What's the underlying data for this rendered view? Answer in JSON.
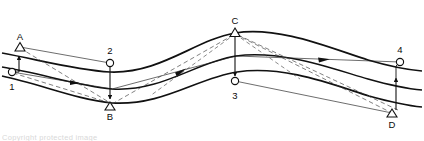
{
  "figure": {
    "stroke_color": "#111111",
    "thin_color": "#2b2b2b",
    "dash_color": "#555555",
    "background": "#ffffff",
    "marker_labels_upper": [
      "A",
      "C"
    ],
    "marker_labels_lower": [
      "B",
      "D"
    ],
    "marker_labels_numeric": [
      "1",
      "2",
      "3",
      "4"
    ],
    "points": [
      {
        "id": "A",
        "label": "A",
        "marker": "triangle",
        "x": 20,
        "y": 47,
        "label_x": 20,
        "label_y": 40
      },
      {
        "id": "B",
        "label": "B",
        "marker": "triangle",
        "x": 110,
        "y": 106,
        "label_x": 110,
        "label_y": 117
      },
      {
        "id": "C",
        "label": "C",
        "marker": "triangle",
        "x": 235,
        "y": 32,
        "label_x": 235,
        "label_y": 24
      },
      {
        "id": "D",
        "label": "D",
        "marker": "triangle",
        "x": 392,
        "y": 113,
        "label_x": 392,
        "label_y": 124
      },
      {
        "id": "1",
        "label": "1",
        "marker": "circle",
        "x": 12,
        "y": 72,
        "label_x": 12,
        "label_y": 88
      },
      {
        "id": "2",
        "label": "2",
        "marker": "circle",
        "x": 110,
        "y": 63,
        "label_x": 110,
        "label_y": 52
      },
      {
        "id": "3",
        "label": "3",
        "marker": "circle",
        "x": 235,
        "y": 81,
        "label_x": 235,
        "label_y": 97
      },
      {
        "id": "4",
        "label": "4",
        "marker": "circle",
        "x": 400,
        "y": 62,
        "label_x": 400,
        "label_y": 51
      }
    ],
    "vertical_connectors": [
      {
        "from": "2",
        "to": "B",
        "direction": "down"
      },
      {
        "from": "C",
        "to": "3",
        "direction": "down"
      },
      {
        "from": "D",
        "to": "4",
        "direction": "up"
      },
      {
        "from": "1",
        "to": "A",
        "direction": "up"
      }
    ],
    "flow_arrow_count": 3,
    "curves": {
      "upper": "M 2,53 C 40,60 75,70 110,72 C 160,74 195,40 235,33 C 280,26 330,48 368,60 C 392,67 410,70 422,71",
      "middle": "M 2,67 C 40,73 78,86 112,89 C 162,92 196,62 236,56 C 282,50 330,68 368,79 C 393,86 410,89 422,90",
      "lower": "M 2,76 C 40,84 78,100 112,103 C 163,106 197,78 237,72 C 283,65 331,84 369,96 C 394,103 411,106 422,107"
    },
    "caption_text": "Copyright protected image"
  }
}
